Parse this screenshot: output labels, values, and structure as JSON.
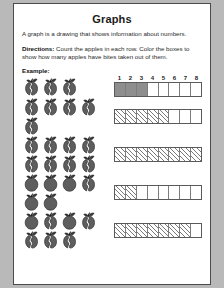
{
  "worksheet": {
    "title": "Graphs",
    "intro": "A graph is a drawing that shows information about numbers.",
    "directions_label": "Directions:",
    "directions_text": " Count the apples in each row. Color the boxes to show how many apples have bites taken out of them.",
    "example_label": "Example:",
    "column_headers": [
      "1",
      "2",
      "3",
      "4",
      "5",
      "6",
      "7",
      "8"
    ],
    "total_columns": 8,
    "colors": {
      "page_background": "#ffffff",
      "margin_background": "#b9b9b9",
      "filled_cell": "#8e8e8e",
      "hatch_line": "#7a7a7a",
      "border": "#5a5a5a",
      "apple_body": "#5e5e5e",
      "text": "#2a2a2a"
    }
  },
  "chart_data": {
    "type": "bar",
    "title": "Graphs",
    "xlabel": "",
    "ylabel": "",
    "categories": [
      "Example",
      "Row 1",
      "Row 2",
      "Row 3",
      "Row 4"
    ],
    "values": [
      3,
      5,
      8,
      2,
      7
    ],
    "xlim": [
      0,
      8
    ],
    "grid": true,
    "legend": "none",
    "annotations": "Each row counts apples with bites taken out of them; boxes colored equal that count."
  },
  "rows": [
    {
      "name": "example-row",
      "is_example": true,
      "apple_count": 3,
      "bitten_count": 3,
      "filled_cells": 3,
      "fill_style": "solid",
      "apples": [
        {
          "bitten": true
        },
        {
          "bitten": true
        },
        {
          "bitten": true
        }
      ]
    },
    {
      "name": "row-1",
      "is_example": false,
      "apple_count": 5,
      "bitten_count": 5,
      "filled_cells": 5,
      "fill_style": "hatch",
      "apples": [
        {
          "bitten": true
        },
        {
          "bitten": true
        },
        {
          "bitten": true
        },
        {
          "bitten": true
        },
        {
          "bitten": true
        }
      ]
    },
    {
      "name": "row-2",
      "is_example": false,
      "apple_count": 8,
      "bitten_count": 8,
      "filled_cells": 8,
      "fill_style": "hatch",
      "apples": [
        {
          "bitten": true
        },
        {
          "bitten": true
        },
        {
          "bitten": true
        },
        {
          "bitten": true
        },
        {
          "bitten": true
        },
        {
          "bitten": true
        },
        {
          "bitten": true
        },
        {
          "bitten": true
        }
      ]
    },
    {
      "name": "row-3",
      "is_example": false,
      "apple_count": 6,
      "bitten_count": 2,
      "filled_cells": 2,
      "fill_style": "hatch",
      "apples": [
        {
          "bitten": false
        },
        {
          "bitten": false
        },
        {
          "bitten": false
        },
        {
          "bitten": true
        },
        {
          "bitten": false
        },
        {
          "bitten": false
        }
      ]
    },
    {
      "name": "row-4",
      "is_example": false,
      "apple_count": 7,
      "bitten_count": 7,
      "filled_cells": 7,
      "fill_style": "hatch",
      "apples": [
        {
          "bitten": false
        },
        {
          "bitten": true
        },
        {
          "bitten": false
        },
        {
          "bitten": true
        },
        {
          "bitten": true
        },
        {
          "bitten": true
        },
        {
          "bitten": true
        }
      ]
    }
  ]
}
